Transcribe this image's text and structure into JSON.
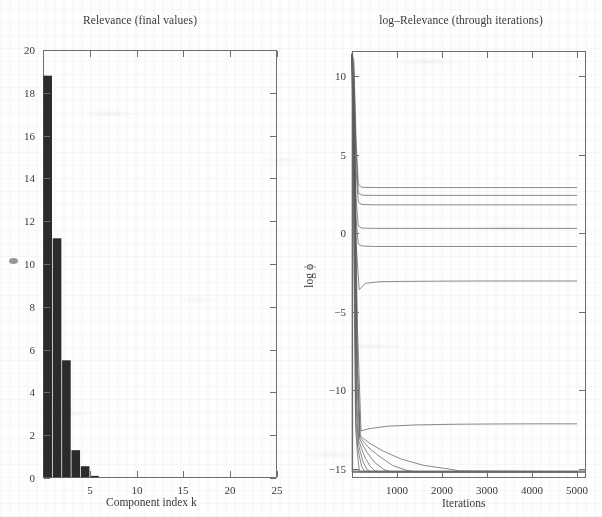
{
  "figure": {
    "background_color": "#fefefe",
    "ink_color": "#2b2b2b",
    "axis_color": "#6e6e72"
  },
  "left_panel": {
    "title": "Relevance (final values)",
    "xlabel": "Component index  k",
    "ylabel": "",
    "y_ticks": [
      "0",
      "2",
      "4",
      "6",
      "8",
      "10",
      "12",
      "14",
      "16",
      "18",
      "20"
    ],
    "x_ticks": [
      "5",
      "10",
      "15",
      "20",
      "25"
    ],
    "marker_icon": "diamond-marker-icon"
  },
  "right_panel": {
    "title": "log–Relevance (through iterations)",
    "xlabel": "Iterations",
    "ylabel": "log ϕ",
    "y_ticks": [
      "10",
      "5",
      "0",
      "−5",
      "−10",
      "−15"
    ],
    "x_ticks": [
      "1000",
      "2000",
      "3000",
      "4000",
      "5000"
    ]
  },
  "chart_data": [
    {
      "type": "bar",
      "title": "Relevance (final values)",
      "xlabel": "Component index  k",
      "ylabel": "",
      "categories": [
        1,
        2,
        3,
        4,
        5,
        6,
        7,
        8,
        9,
        10,
        11,
        12,
        13,
        14,
        15,
        16,
        17,
        18,
        19,
        20,
        21,
        22,
        23,
        24,
        25
      ],
      "values": [
        18.8,
        11.2,
        5.5,
        1.3,
        0.55,
        0.1,
        0.0,
        0.0,
        0.0,
        0.0,
        0.0,
        0.0,
        0.0,
        0.0,
        0.0,
        0.0,
        0.0,
        0.0,
        0.0,
        0.0,
        0.0,
        0.0,
        0.0,
        0.0,
        0.0
      ],
      "xlim": [
        0,
        25
      ],
      "ylim": [
        0,
        20
      ],
      "y_ticks": [
        0,
        2,
        4,
        6,
        8,
        10,
        12,
        14,
        16,
        18,
        20
      ],
      "x_ticks": [
        5,
        10,
        15,
        20,
        25
      ],
      "grid": false,
      "legend": "none",
      "bar_color": "#2b2b2b"
    },
    {
      "type": "line",
      "title": "log–Relevance (through iterations)",
      "xlabel": "Iterations",
      "ylabel": "log ϕ",
      "xlim": [
        0,
        5200
      ],
      "ylim": [
        -15.6,
        11.6
      ],
      "y_ticks": [
        10,
        5,
        0,
        -5,
        -10,
        -15
      ],
      "x_ticks": [
        1000,
        2000,
        3000,
        4000,
        5000
      ],
      "grid": false,
      "legend": "none",
      "note": "All 25 components initialise near log phi = 11 then collapse within the first ~150 iterations; six survive at positive plateaus, the remainder decay to the numerical floor near -15.",
      "series": [
        {
          "name": "k=1",
          "x": [
            0,
            40,
            90,
            140,
            220,
            500,
            1000,
            2000,
            3000,
            4000,
            5000
          ],
          "values": [
            11.4,
            11.0,
            6.0,
            3.1,
            2.92,
            2.9,
            2.9,
            2.9,
            2.9,
            2.9,
            2.9
          ]
        },
        {
          "name": "k=2",
          "x": [
            0,
            40,
            90,
            140,
            220,
            500,
            1000,
            2000,
            3000,
            4000,
            5000
          ],
          "values": [
            11.4,
            10.6,
            5.2,
            2.55,
            2.42,
            2.4,
            2.4,
            2.4,
            2.4,
            2.4,
            2.4
          ]
        },
        {
          "name": "k=3",
          "x": [
            0,
            40,
            90,
            140,
            220,
            500,
            1000,
            2000,
            3000,
            4000,
            5000
          ],
          "values": [
            11.4,
            9.8,
            4.1,
            1.95,
            1.82,
            1.8,
            1.8,
            1.8,
            1.8,
            1.8,
            1.8
          ]
        },
        {
          "name": "k=4",
          "x": [
            0,
            40,
            90,
            140,
            220,
            500,
            1000,
            2000,
            3000,
            4000,
            5000
          ],
          "values": [
            11.4,
            9.0,
            2.2,
            0.45,
            0.32,
            0.3,
            0.3,
            0.3,
            0.3,
            0.3,
            0.3
          ]
        },
        {
          "name": "k=5",
          "x": [
            0,
            40,
            90,
            140,
            220,
            500,
            1000,
            2000,
            3000,
            4000,
            5000
          ],
          "values": [
            11.4,
            8.2,
            0.9,
            -0.7,
            -0.82,
            -0.85,
            -0.85,
            -0.85,
            -0.85,
            -0.85,
            -0.85
          ]
        },
        {
          "name": "k=6",
          "x": [
            0,
            40,
            90,
            160,
            300,
            600,
            1000,
            2000,
            3000,
            4000,
            5000
          ],
          "values": [
            11.4,
            7.4,
            -0.6,
            -3.6,
            -3.2,
            -3.1,
            -3.08,
            -3.06,
            -3.05,
            -3.05,
            -3.05
          ]
        },
        {
          "name": "k=7",
          "x": [
            0,
            60,
            120,
            200,
            400,
            800,
            1400,
            2200,
            3000,
            4000,
            5000
          ],
          "values": [
            11.4,
            5.0,
            -6.0,
            -12.6,
            -12.45,
            -12.3,
            -12.22,
            -12.18,
            -12.16,
            -12.15,
            -12.15
          ]
        },
        {
          "name": "k=8",
          "x": [
            0,
            60,
            120,
            180,
            260,
            400,
            700,
            1100,
            1600,
            2200,
            2400,
            5000
          ],
          "values": [
            11.4,
            4.0,
            -8.0,
            -12.9,
            -13.1,
            -13.4,
            -13.9,
            -14.4,
            -14.8,
            -15.05,
            -15.15,
            -15.2
          ]
        },
        {
          "name": "k=9",
          "x": [
            0,
            60,
            120,
            180,
            260,
            380,
            600,
            900,
            1200,
            1400,
            5000
          ],
          "values": [
            11.4,
            3.4,
            -8.8,
            -13.0,
            -13.3,
            -13.7,
            -14.2,
            -14.8,
            -15.1,
            -15.2,
            -15.2
          ]
        },
        {
          "name": "k=10",
          "x": [
            0,
            60,
            110,
            170,
            240,
            340,
            500,
            700,
            860,
            5000
          ],
          "values": [
            11.4,
            2.8,
            -9.6,
            -13.1,
            -13.5,
            -14.0,
            -14.6,
            -15.05,
            -15.2,
            -15.2
          ]
        },
        {
          "name": "k=11",
          "x": [
            0,
            50,
            100,
            150,
            210,
            290,
            400,
            520,
            620,
            5000
          ],
          "values": [
            11.4,
            2.0,
            -10.4,
            -13.2,
            -13.7,
            -14.3,
            -14.85,
            -15.15,
            -15.2,
            -15.2
          ]
        },
        {
          "name": "k=12",
          "x": [
            0,
            50,
            95,
            140,
            190,
            250,
            330,
            420,
            5000
          ],
          "values": [
            11.4,
            1.2,
            -11.2,
            -13.4,
            -14.0,
            -14.6,
            -15.05,
            -15.2,
            -15.2
          ]
        },
        {
          "name": "k=13",
          "x": [
            0,
            45,
            85,
            125,
            170,
            220,
            290,
            5000
          ],
          "values": [
            11.4,
            0.2,
            -11.8,
            -13.6,
            -14.3,
            -14.9,
            -15.2,
            -15.2
          ]
        },
        {
          "name": "k=14+",
          "x": [
            0,
            40,
            80,
            120,
            165,
            5000
          ],
          "values": [
            11.4,
            -1.0,
            -12.4,
            -14.0,
            -15.2,
            -15.2
          ]
        }
      ]
    }
  ]
}
